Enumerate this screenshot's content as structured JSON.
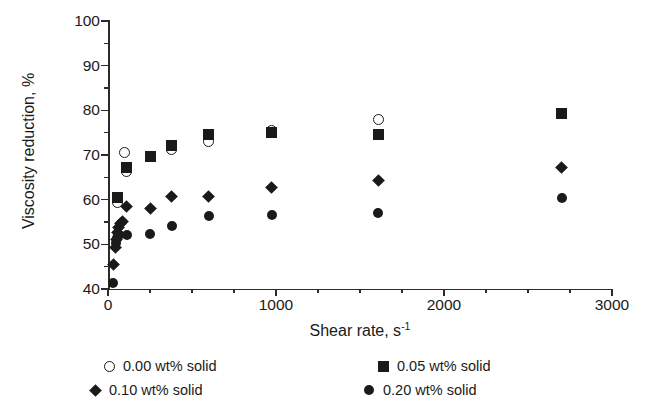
{
  "chart_data": {
    "type": "scatter",
    "title": "",
    "xlabel": "Shear rate, s",
    "xlabel_sup": "-1",
    "ylabel": "Viscosity reduction, %",
    "xlim": [
      0,
      3000
    ],
    "ylim": [
      40,
      100
    ],
    "xticks": [
      0,
      1000,
      2000,
      3000
    ],
    "xtick_labels": [
      "0",
      "1000",
      "2000",
      "3000"
    ],
    "x_minor_interval": 250,
    "yticks": [
      40,
      50,
      60,
      70,
      80,
      90,
      100
    ],
    "ytick_labels": [
      "40",
      "50",
      "60",
      "70",
      "80",
      "90",
      "100"
    ],
    "y_minor_interval": 5,
    "grid": false,
    "legend_position": "below",
    "marker_color": "#1a1a1a",
    "series": [
      {
        "name": "0.00 wt% solid",
        "marker": "circle-open",
        "points": [
          {
            "x": 58,
            "y": 59.4
          },
          {
            "x": 98,
            "y": 70.5
          },
          {
            "x": 112,
            "y": 66.4
          },
          {
            "x": 250,
            "y": 69.6
          },
          {
            "x": 380,
            "y": 71.2
          },
          {
            "x": 600,
            "y": 73.0
          },
          {
            "x": 975,
            "y": 75.4
          },
          {
            "x": 1610,
            "y": 77.9
          }
        ]
      },
      {
        "name": "0.05 wt% solid",
        "marker": "square-filled",
        "points": [
          {
            "x": 58,
            "y": 60.4
          },
          {
            "x": 112,
            "y": 67.2
          },
          {
            "x": 250,
            "y": 69.6
          },
          {
            "x": 380,
            "y": 72.1
          },
          {
            "x": 600,
            "y": 74.6
          },
          {
            "x": 975,
            "y": 75.0
          },
          {
            "x": 1610,
            "y": 74.5
          },
          {
            "x": 2700,
            "y": 79.4
          }
        ]
      },
      {
        "name": "0.10 wt% solid",
        "marker": "diamond-filled",
        "points": [
          {
            "x": 30,
            "y": 45.5
          },
          {
            "x": 45,
            "y": 49.3
          },
          {
            "x": 52,
            "y": 51.0
          },
          {
            "x": 58,
            "y": 52.6
          },
          {
            "x": 62,
            "y": 53.8
          },
          {
            "x": 72,
            "y": 54.6
          },
          {
            "x": 88,
            "y": 55.2
          },
          {
            "x": 112,
            "y": 58.4
          },
          {
            "x": 250,
            "y": 58.0
          },
          {
            "x": 380,
            "y": 60.6
          },
          {
            "x": 600,
            "y": 60.6
          },
          {
            "x": 975,
            "y": 62.8
          },
          {
            "x": 1610,
            "y": 64.2
          },
          {
            "x": 2700,
            "y": 67.2
          }
        ]
      },
      {
        "name": "0.20 wt% solid",
        "marker": "circle-filled",
        "points": [
          {
            "x": 30,
            "y": 41.3
          },
          {
            "x": 48,
            "y": 50.2
          },
          {
            "x": 56,
            "y": 51.4
          },
          {
            "x": 64,
            "y": 52.0
          },
          {
            "x": 112,
            "y": 52.1
          },
          {
            "x": 250,
            "y": 52.4
          },
          {
            "x": 380,
            "y": 54.0
          },
          {
            "x": 600,
            "y": 56.4
          },
          {
            "x": 975,
            "y": 56.5
          },
          {
            "x": 1610,
            "y": 57.0
          },
          {
            "x": 2700,
            "y": 60.4
          }
        ]
      }
    ]
  },
  "legend": {
    "items": [
      {
        "label": "0.00 wt% solid",
        "marker": "circle-open"
      },
      {
        "label": "0.05 wt% solid",
        "marker": "square-filled"
      },
      {
        "label": "0.10 wt% solid",
        "marker": "diamond-filled"
      },
      {
        "label": "0.20 wt% solid",
        "marker": "circle-filled"
      }
    ]
  }
}
